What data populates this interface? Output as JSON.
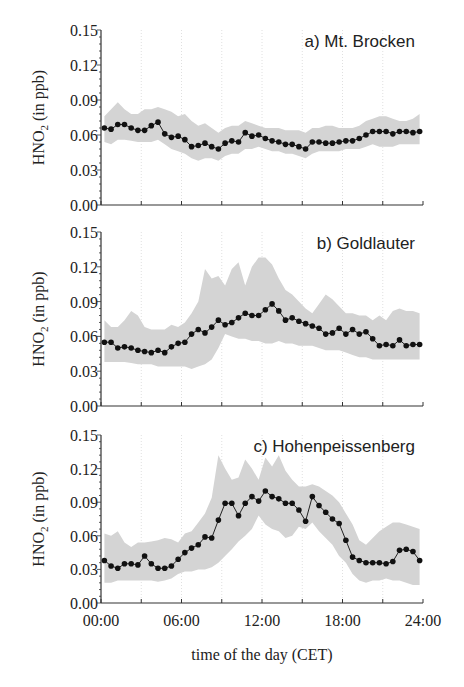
{
  "figure": {
    "xlabel": "time of the day  (CET)",
    "ylabel_main": "HNO",
    "ylabel_sub": "2",
    "ylabel_unit": "  (in ppb)",
    "x_tick_labels": [
      "00:00",
      "06:00",
      "12:00",
      "18:00",
      "24:00"
    ],
    "y_tick_labels": [
      "0.00",
      "0.03",
      "0.06",
      "0.09",
      "0.12",
      "0.15"
    ]
  },
  "chart_data": [
    {
      "type": "line",
      "title": "a) Mt. Brocken",
      "xlabel": "time of the day (CET)",
      "ylabel": "HNO2 (in ppb)",
      "xlim": [
        0,
        24
      ],
      "ylim": [
        0,
        0.15
      ],
      "x_ticks": [
        0,
        3,
        6,
        9,
        12,
        15,
        18,
        21,
        24
      ],
      "y_ticks": [
        0.0,
        0.03,
        0.06,
        0.09,
        0.12,
        0.15
      ],
      "grid": "vertical dotted every 3 h",
      "x": [
        0.25,
        0.75,
        1.25,
        1.75,
        2.25,
        2.75,
        3.25,
        3.75,
        4.25,
        4.75,
        5.25,
        5.75,
        6.25,
        6.75,
        7.25,
        7.75,
        8.25,
        8.75,
        9.25,
        9.75,
        10.25,
        10.75,
        11.25,
        11.75,
        12.25,
        12.75,
        13.25,
        13.75,
        14.25,
        14.75,
        15.25,
        15.75,
        16.25,
        16.75,
        17.25,
        17.75,
        18.25,
        18.75,
        19.25,
        19.75,
        20.25,
        20.75,
        21.25,
        21.75,
        22.25,
        22.75,
        23.25,
        23.75
      ],
      "series": [
        {
          "name": "mean",
          "values": [
            0.066,
            0.065,
            0.069,
            0.069,
            0.066,
            0.064,
            0.064,
            0.068,
            0.071,
            0.061,
            0.058,
            0.059,
            0.056,
            0.05,
            0.051,
            0.053,
            0.05,
            0.048,
            0.053,
            0.055,
            0.054,
            0.062,
            0.059,
            0.06,
            0.057,
            0.055,
            0.054,
            0.052,
            0.052,
            0.05,
            0.048,
            0.054,
            0.054,
            0.053,
            0.053,
            0.054,
            0.055,
            0.055,
            0.057,
            0.06,
            0.063,
            0.063,
            0.063,
            0.061,
            0.063,
            0.063,
            0.062,
            0.063
          ]
        },
        {
          "name": "upper",
          "values": [
            0.076,
            0.082,
            0.088,
            0.082,
            0.078,
            0.078,
            0.082,
            0.082,
            0.084,
            0.082,
            0.08,
            0.076,
            0.078,
            0.072,
            0.068,
            0.07,
            0.066,
            0.062,
            0.066,
            0.068,
            0.068,
            0.072,
            0.07,
            0.068,
            0.066,
            0.066,
            0.066,
            0.064,
            0.064,
            0.064,
            0.062,
            0.066,
            0.066,
            0.068,
            0.068,
            0.066,
            0.066,
            0.066,
            0.068,
            0.072,
            0.074,
            0.076,
            0.076,
            0.074,
            0.072,
            0.072,
            0.074,
            0.078
          ]
        },
        {
          "name": "lower",
          "values": [
            0.054,
            0.052,
            0.056,
            0.056,
            0.055,
            0.054,
            0.054,
            0.054,
            0.056,
            0.052,
            0.048,
            0.046,
            0.044,
            0.04,
            0.038,
            0.04,
            0.04,
            0.038,
            0.042,
            0.044,
            0.044,
            0.048,
            0.048,
            0.05,
            0.048,
            0.046,
            0.046,
            0.044,
            0.044,
            0.042,
            0.04,
            0.044,
            0.046,
            0.046,
            0.046,
            0.046,
            0.048,
            0.048,
            0.048,
            0.05,
            0.052,
            0.05,
            0.05,
            0.05,
            0.052,
            0.052,
            0.052,
            0.052
          ]
        }
      ]
    },
    {
      "type": "line",
      "title": "b) Goldlauter",
      "xlabel": "time of the day (CET)",
      "ylabel": "HNO2 (in ppb)",
      "xlim": [
        0,
        24
      ],
      "ylim": [
        0,
        0.15
      ],
      "x_ticks": [
        0,
        3,
        6,
        9,
        12,
        15,
        18,
        21,
        24
      ],
      "y_ticks": [
        0.0,
        0.03,
        0.06,
        0.09,
        0.12,
        0.15
      ],
      "grid": "vertical dotted every 3 h",
      "x": [
        0.25,
        0.75,
        1.25,
        1.75,
        2.25,
        2.75,
        3.25,
        3.75,
        4.25,
        4.75,
        5.25,
        5.75,
        6.25,
        6.75,
        7.25,
        7.75,
        8.25,
        8.75,
        9.25,
        9.75,
        10.25,
        10.75,
        11.25,
        11.75,
        12.25,
        12.75,
        13.25,
        13.75,
        14.25,
        14.75,
        15.25,
        15.75,
        16.25,
        16.75,
        17.25,
        17.75,
        18.25,
        18.75,
        19.25,
        19.75,
        20.25,
        20.75,
        21.25,
        21.75,
        22.25,
        22.75,
        23.25,
        23.75
      ],
      "series": [
        {
          "name": "mean",
          "values": [
            0.055,
            0.055,
            0.05,
            0.051,
            0.05,
            0.048,
            0.047,
            0.046,
            0.048,
            0.046,
            0.051,
            0.054,
            0.055,
            0.062,
            0.066,
            0.063,
            0.068,
            0.074,
            0.07,
            0.072,
            0.076,
            0.08,
            0.078,
            0.078,
            0.083,
            0.088,
            0.082,
            0.074,
            0.076,
            0.073,
            0.071,
            0.069,
            0.067,
            0.062,
            0.063,
            0.067,
            0.062,
            0.066,
            0.062,
            0.064,
            0.058,
            0.052,
            0.053,
            0.052,
            0.057,
            0.052,
            0.053,
            0.053
          ]
        },
        {
          "name": "upper",
          "values": [
            0.074,
            0.068,
            0.068,
            0.074,
            0.082,
            0.078,
            0.068,
            0.066,
            0.066,
            0.066,
            0.07,
            0.068,
            0.072,
            0.08,
            0.09,
            0.118,
            0.11,
            0.112,
            0.104,
            0.118,
            0.124,
            0.104,
            0.12,
            0.128,
            0.128,
            0.122,
            0.11,
            0.1,
            0.096,
            0.09,
            0.084,
            0.08,
            0.088,
            0.096,
            0.092,
            0.086,
            0.08,
            0.08,
            0.078,
            0.078,
            0.074,
            0.078,
            0.074,
            0.082,
            0.084,
            0.082,
            0.082,
            0.08
          ]
        },
        {
          "name": "lower",
          "values": [
            0.038,
            0.038,
            0.038,
            0.038,
            0.037,
            0.036,
            0.036,
            0.036,
            0.034,
            0.034,
            0.034,
            0.034,
            0.034,
            0.032,
            0.034,
            0.036,
            0.04,
            0.05,
            0.062,
            0.06,
            0.058,
            0.058,
            0.056,
            0.056,
            0.054,
            0.054,
            0.056,
            0.054,
            0.054,
            0.052,
            0.052,
            0.052,
            0.05,
            0.048,
            0.048,
            0.048,
            0.046,
            0.044,
            0.042,
            0.042,
            0.04,
            0.04,
            0.04,
            0.04,
            0.04,
            0.04,
            0.04,
            0.04
          ]
        }
      ]
    },
    {
      "type": "line",
      "title": "c) Hohenpeissenberg",
      "xlabel": "time of the day (CET)",
      "ylabel": "HNO2 (in ppb)",
      "xlim": [
        0,
        24
      ],
      "ylim": [
        0,
        0.15
      ],
      "x_ticks": [
        0,
        3,
        6,
        9,
        12,
        15,
        18,
        21,
        24
      ],
      "y_ticks": [
        0.0,
        0.03,
        0.06,
        0.09,
        0.12,
        0.15
      ],
      "grid": "vertical dotted every 3 h",
      "x": [
        0.25,
        0.75,
        1.25,
        1.75,
        2.25,
        2.75,
        3.25,
        3.75,
        4.25,
        4.75,
        5.25,
        5.75,
        6.25,
        6.75,
        7.25,
        7.75,
        8.25,
        8.75,
        9.25,
        9.75,
        10.25,
        10.75,
        11.25,
        11.75,
        12.25,
        12.75,
        13.25,
        13.75,
        14.25,
        14.75,
        15.25,
        15.75,
        16.25,
        16.75,
        17.25,
        17.75,
        18.25,
        18.75,
        19.25,
        19.75,
        20.25,
        20.75,
        21.25,
        21.75,
        22.25,
        22.75,
        23.25,
        23.75
      ],
      "series": [
        {
          "name": "mean",
          "values": [
            0.038,
            0.033,
            0.031,
            0.035,
            0.035,
            0.034,
            0.042,
            0.035,
            0.031,
            0.031,
            0.033,
            0.039,
            0.045,
            0.049,
            0.052,
            0.059,
            0.058,
            0.074,
            0.089,
            0.089,
            0.078,
            0.089,
            0.095,
            0.091,
            0.1,
            0.095,
            0.093,
            0.089,
            0.089,
            0.083,
            0.073,
            0.095,
            0.087,
            0.081,
            0.075,
            0.071,
            0.056,
            0.041,
            0.038,
            0.036,
            0.036,
            0.036,
            0.035,
            0.037,
            0.047,
            0.048,
            0.046,
            0.038
          ]
        },
        {
          "name": "upper",
          "values": [
            0.062,
            0.06,
            0.064,
            0.054,
            0.05,
            0.054,
            0.054,
            0.055,
            0.056,
            0.058,
            0.057,
            0.054,
            0.062,
            0.064,
            0.072,
            0.08,
            0.094,
            0.132,
            0.12,
            0.11,
            0.112,
            0.128,
            0.12,
            0.11,
            0.13,
            0.122,
            0.132,
            0.118,
            0.11,
            0.104,
            0.104,
            0.106,
            0.104,
            0.1,
            0.096,
            0.09,
            0.08,
            0.07,
            0.056,
            0.052,
            0.058,
            0.064,
            0.068,
            0.072,
            0.072,
            0.07,
            0.068,
            0.066
          ]
        },
        {
          "name": "lower",
          "values": [
            0.018,
            0.018,
            0.02,
            0.02,
            0.02,
            0.02,
            0.02,
            0.02,
            0.019,
            0.02,
            0.022,
            0.026,
            0.028,
            0.028,
            0.03,
            0.03,
            0.032,
            0.036,
            0.042,
            0.048,
            0.055,
            0.06,
            0.066,
            0.078,
            0.07,
            0.066,
            0.064,
            0.058,
            0.06,
            0.068,
            0.066,
            0.072,
            0.064,
            0.058,
            0.052,
            0.042,
            0.036,
            0.026,
            0.02,
            0.018,
            0.02,
            0.02,
            0.022,
            0.02,
            0.02,
            0.018,
            0.016,
            0.016
          ]
        }
      ]
    }
  ]
}
